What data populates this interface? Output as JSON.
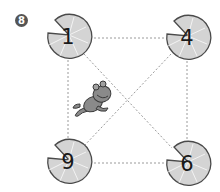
{
  "problem": {
    "number": "8"
  },
  "pads": [
    {
      "label": "1",
      "cx": 68,
      "cy": 37,
      "position": "top-left"
    },
    {
      "label": "4",
      "cx": 187,
      "cy": 38,
      "position": "top-right"
    },
    {
      "label": "9",
      "cx": 68,
      "cy": 162,
      "position": "bottom-left"
    },
    {
      "label": "6",
      "cx": 187,
      "cy": 164,
      "position": "bottom-right"
    }
  ],
  "connections": [
    {
      "from": "1",
      "to": "4",
      "style": "dashed"
    },
    {
      "from": "1",
      "to": "9",
      "style": "dashed"
    },
    {
      "from": "4",
      "to": "6",
      "style": "dashed"
    },
    {
      "from": "9",
      "to": "6",
      "style": "dashed"
    },
    {
      "from": "1",
      "to": "6",
      "style": "dashed"
    },
    {
      "from": "4",
      "to": "9",
      "style": "dashed"
    }
  ],
  "frog": {
    "description": "frog jumping",
    "cx": 95,
    "cy": 98
  },
  "colors": {
    "pad_fill": "#d4d4d4",
    "pad_stroke": "#4a4a4a",
    "vein": "#ffffff",
    "dash": "#9a9a9a",
    "frog_fill": "#8a8a8a",
    "frog_stroke": "#3a3a3a",
    "badge": "#555555"
  }
}
